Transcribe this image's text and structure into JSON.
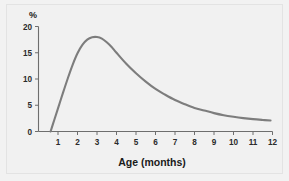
{
  "chart_data": {
    "type": "line",
    "title": "",
    "xlabel": "Age (months)",
    "ylabel": "%",
    "xlim": [
      0,
      12
    ],
    "ylim": [
      0,
      20
    ],
    "grid": false,
    "legend": null,
    "xticks": [
      "1",
      "2",
      "3",
      "4",
      "5",
      "6",
      "7",
      "8",
      "9",
      "10",
      "11",
      "12"
    ],
    "xtick_values": [
      1,
      2,
      3,
      4,
      5,
      6,
      7,
      8,
      9,
      10,
      11,
      12
    ],
    "yticks": [
      "0",
      "5",
      "10",
      "15",
      "20"
    ],
    "ytick_values": [
      0,
      5,
      10,
      15,
      20
    ],
    "series": [
      {
        "name": "prevalence",
        "color": "#7d7d7d",
        "x": [
          0.62,
          0.8,
          1.0,
          1.25,
          1.5,
          1.75,
          2.0,
          2.25,
          2.5,
          2.75,
          3.0,
          3.25,
          3.5,
          3.75,
          4.0,
          4.5,
          5.0,
          5.5,
          6.0,
          6.5,
          7.0,
          7.5,
          8.0,
          8.5,
          9.0,
          9.5,
          10.0,
          10.5,
          11.0,
          11.5,
          11.9
        ],
        "values": [
          0.0,
          2.1,
          4.4,
          7.3,
          10.1,
          12.7,
          14.9,
          16.5,
          17.5,
          17.95,
          18.0,
          17.7,
          17.0,
          16.1,
          15.0,
          12.9,
          11.1,
          9.5,
          8.1,
          7.0,
          6.0,
          5.2,
          4.5,
          4.0,
          3.5,
          3.1,
          2.8,
          2.55,
          2.35,
          2.2,
          2.1
        ]
      }
    ]
  },
  "axes": {
    "y_axis_label": "%",
    "x_axis_label": "Age (months)"
  }
}
